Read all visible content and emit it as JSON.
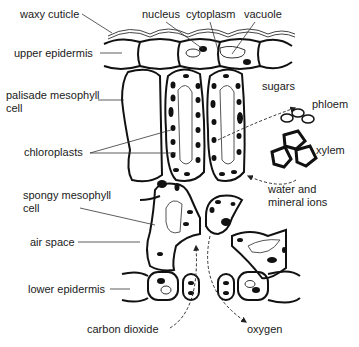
{
  "diagram": {
    "labels": {
      "waxy_cuticle": "waxy cuticle",
      "nucleus": "nucleus",
      "cytoplasm": "cytoplasm",
      "vacuole": "vacuole",
      "upper_epidermis": "upper epidermis",
      "palisade_mesophyll_cell": "palisade mesophyll\ncell",
      "sugars": "sugars",
      "phloem": "phloem",
      "chloroplasts": "chloroplasts",
      "xylem": "xylem",
      "spongy_mesophyll_cell": "spongy mesophyll\ncell",
      "water_and_mineral_ions": "water and\nmineral ions",
      "air_space": "air space",
      "lower_epidermis": "lower epidermis",
      "carbon_dioxide": "carbon dioxide",
      "oxygen": "oxygen"
    },
    "colors": {
      "line": "#111111",
      "label_line": "#333333",
      "background": "#ffffff"
    }
  }
}
